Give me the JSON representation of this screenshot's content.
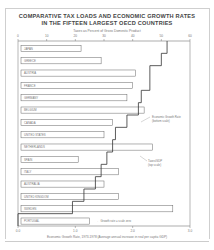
{
  "chart_data": {
    "type": "bar",
    "title": "COMPARATIVE TAX LOADS AND ECONOMIC GROWTH RATES IN THE FIFTEEN LARGEST OECD COUNTRIES",
    "title_line1": "COMPARATIVE TAX LOADS AND ECONOMIC GROWTH RATES",
    "title_line2": "IN THE FIFTEEN LARGEST OECD COUNTRIES",
    "top_axis_label": "Taxes as Percent of Gross Domestic Product",
    "bottom_axis_label": "Economic Growth Rate, 1973-1978 (Average annual increase in real per capita GDP)",
    "top_ticks": [
      0,
      10,
      20,
      30,
      40,
      50,
      60
    ],
    "bottom_ticks": [
      "0.0",
      "1.0",
      "2.0",
      "3.0"
    ],
    "categories": [
      "JAPAN",
      "GREECE",
      "AUSTRIA",
      "FRANCE",
      "GERMANY",
      "BELGIUM",
      "CANADA",
      "UNITED STATES",
      "NETHERLANDS",
      "SPAIN",
      "ITALY",
      "AUSTRALIA",
      "UNITED KINGDOM",
      "SWEDEN",
      "PORTUGAL"
    ],
    "series": [
      {
        "name": "Taxes/GDP (top scale)",
        "type": "bar",
        "values": [
          22,
          29,
          41,
          40,
          38,
          44,
          33,
          30,
          47,
          21,
          35,
          30,
          35,
          54,
          25
        ]
      },
      {
        "name": "Economic Growth Rate (bottom scale)",
        "type": "step-line",
        "values": [
          2.6,
          2.5,
          2.3,
          2.3,
          2.15,
          2.1,
          1.9,
          1.7,
          1.65,
          1.55,
          1.45,
          1.35,
          1.15,
          0.95,
          0.0
        ]
      }
    ],
    "annotations": [
      "Economic Growth Rate (bottom scale)",
      "Taxes/GDP (top scale)",
      "Growth rate = scale zero"
    ],
    "xlim_top": [
      0,
      60
    ],
    "xlim_bottom": [
      0,
      3.0
    ],
    "grid": false
  }
}
